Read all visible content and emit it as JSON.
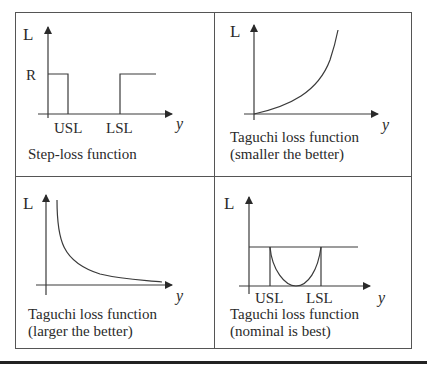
{
  "figure": {
    "type": "loss-function-comparison-grid",
    "panels": [
      {
        "id": "step-loss",
        "y_axis_label": "L",
        "x_axis_label": "y",
        "level_label": "R",
        "tick_labels": [
          "USL",
          "LSL"
        ],
        "caption_lines": [
          "Step-loss function"
        ]
      },
      {
        "id": "smaller-the-better",
        "y_axis_label": "L",
        "x_axis_label": "y",
        "caption_lines": [
          "Taguchi loss function",
          "(smaller the better)"
        ]
      },
      {
        "id": "larger-the-better",
        "y_axis_label": "L",
        "x_axis_label": "y",
        "caption_lines": [
          "Taguchi loss function",
          "(larger the better)"
        ]
      },
      {
        "id": "nominal-is-best",
        "y_axis_label": "L",
        "x_axis_label": "y",
        "tick_labels": [
          "USL",
          "LSL"
        ],
        "caption_lines": [
          "Taguchi loss function",
          "(nominal is best)"
        ]
      }
    ],
    "colors": {
      "line": "#3a3a3a",
      "border": "#555555",
      "text": "#2a2a2a",
      "background": "#ffffff"
    }
  }
}
